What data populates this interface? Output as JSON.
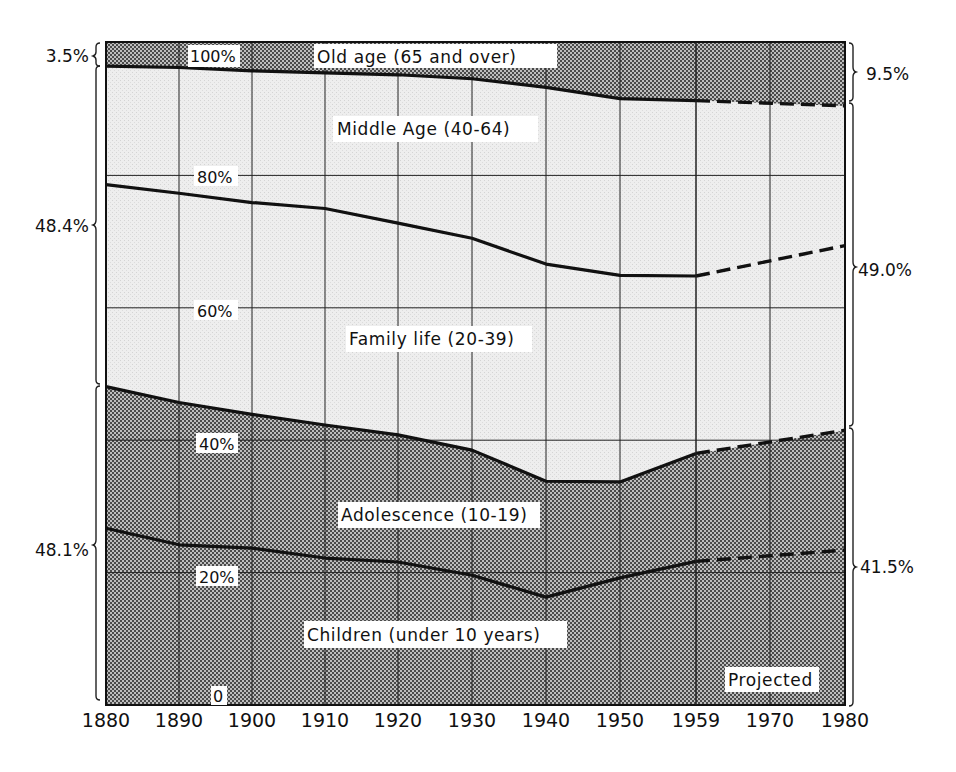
{
  "chart_data": {
    "type": "area",
    "stacked": true,
    "title": "",
    "xlabel": "",
    "ylabel": "",
    "ylim": [
      0,
      100
    ],
    "grid": true,
    "x": [
      1880,
      1890,
      1900,
      1910,
      1920,
      1930,
      1940,
      1950,
      1959,
      1980
    ],
    "x_tick_labels": [
      "1880",
      "1890",
      "1900",
      "1910",
      "1920",
      "1930",
      "1940",
      "1950",
      "1959",
      "1970",
      "1980"
    ],
    "y_tick_labels": [
      "0",
      "20%",
      "40%",
      "60%",
      "80%",
      "100%"
    ],
    "projected_from": 1959,
    "projected_label": "Projected",
    "cumulative_boundaries": [
      {
        "name": "Children / Adolescence boundary",
        "values": [
          26.7,
          24.2,
          23.7,
          22.2,
          21.6,
          19.6,
          16.3,
          19.2,
          21.7,
          23.4
        ]
      },
      {
        "name": "Adolescence / Family life boundary",
        "values": [
          48.1,
          45.7,
          43.9,
          42.3,
          40.8,
          38.5,
          33.8,
          33.7,
          38.0,
          41.5
        ]
      },
      {
        "name": "Family life / Middle age boundary",
        "values": [
          78.6,
          77.3,
          75.9,
          75.0,
          72.8,
          70.5,
          66.6,
          64.9,
          64.8,
          69.4
        ]
      },
      {
        "name": "Middle age / Old age boundary",
        "values": [
          96.5,
          96.3,
          95.8,
          95.5,
          95.2,
          94.6,
          93.3,
          91.6,
          91.3,
          90.5
        ]
      }
    ],
    "series": [
      {
        "name": "Children (under 10 years)",
        "values": [
          26.7,
          24.2,
          23.7,
          22.2,
          21.6,
          19.6,
          16.3,
          19.2,
          21.7,
          23.4
        ]
      },
      {
        "name": "Adolescence (10-19)",
        "values": [
          21.4,
          21.5,
          20.2,
          20.1,
          19.2,
          18.9,
          17.5,
          14.5,
          16.3,
          18.1
        ]
      },
      {
        "name": "Family life (20-39)",
        "values": [
          30.5,
          31.6,
          32.0,
          32.7,
          32.0,
          32.0,
          32.8,
          31.2,
          26.8,
          27.9
        ]
      },
      {
        "name": "Middle Age (40-64)",
        "values": [
          17.9,
          19.0,
          19.9,
          20.5,
          22.4,
          24.1,
          26.7,
          26.7,
          26.5,
          21.1
        ]
      },
      {
        "name": "Old age (65 and over)",
        "values": [
          3.5,
          3.7,
          4.2,
          4.5,
          4.8,
          5.4,
          6.7,
          8.4,
          8.7,
          9.5
        ]
      }
    ],
    "annotations": {
      "left": [
        {
          "label": "3.5%",
          "spans": "Old age, 1880"
        },
        {
          "label": "48.4%",
          "spans": "Middle Age + Family life, 1880"
        },
        {
          "label": "48.1%",
          "spans": "Adolescence + Children, 1880"
        }
      ],
      "right": [
        {
          "label": "9.5%",
          "spans": "Old age, 1980"
        },
        {
          "label": "49.0%",
          "spans": "Middle Age + Family life, 1980"
        },
        {
          "label": "41.5%",
          "spans": "Adolescence + Children, 1980"
        }
      ]
    }
  },
  "labels": {
    "bands": {
      "old_age": "Old age (65 and over)",
      "middle_age": "Middle Age (40-64)",
      "family_life": "Family life (20-39)",
      "adolescence": "Adolescence (10-19)",
      "children": "Children (under 10 years)"
    },
    "projected": "Projected",
    "yticks": {
      "y0": "0",
      "y20": "20%",
      "y40": "40%",
      "y60": "60%",
      "y80": "80%",
      "y100": "100%"
    },
    "xticks": {
      "t1880": "1880",
      "t1890": "1890",
      "t1900": "1900",
      "t1910": "1910",
      "t1920": "1920",
      "t1930": "1930",
      "t1940": "1940",
      "t1950": "1950",
      "t1959": "1959",
      "t1970": "1970",
      "t1980": "1980"
    },
    "left_brackets": {
      "top": "3.5%",
      "middle": "48.4%",
      "bottom": "48.1%"
    },
    "right_brackets": {
      "top": "9.5%",
      "middle": "49.0%",
      "bottom": "41.5%"
    }
  },
  "colors": {
    "dark_fill": "#8c8c8c",
    "light_fill": "#e9e9e9",
    "line": "#111111",
    "grid": "#222222",
    "label_bg": "#ffffff"
  }
}
